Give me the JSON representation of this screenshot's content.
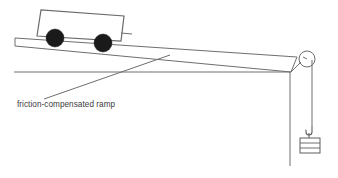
{
  "figure": {
    "background_color": "#ffffff",
    "line_color": "#6e6e6e",
    "wheel_color": "#1a1a1a",
    "text_color": "#3c3c3c"
  },
  "labels": {
    "ramp_caption": "friction-compensated ramp"
  },
  "parts": {
    "cart_name": "trolley",
    "wheel_front_name": "front-wheel",
    "wheel_rear_name": "rear-wheel",
    "ramp_name": "inclined-ramp",
    "pulley_name": "pulley",
    "string_name": "string",
    "hanging_mass_name": "slotted-mass-hanger",
    "table_edge_name": "table-edge",
    "leader_name": "caption-leader-line"
  },
  "geometry": {
    "ramp_top_left": [
      15,
      38
    ],
    "ramp_top_right": [
      296,
      57
    ],
    "ramp_bottom_left": [
      15,
      46
    ],
    "ramp_bottom_right": [
      290,
      72
    ],
    "pulley_center": [
      307,
      59
    ],
    "pulley_radius": 8,
    "table_line_left": [
      14,
      72
    ],
    "table_line_right": [
      290,
      72
    ],
    "table_edge_top": [
      290,
      72
    ],
    "table_edge_bottom": [
      290,
      166
    ],
    "string_top": [
      311,
      66
    ],
    "string_bottom": [
      311,
      127
    ],
    "mass_box": [
      302,
      136,
      20,
      16
    ],
    "caption_position": [
      17,
      106
    ],
    "leader_start": [
      44,
      99
    ],
    "leader_end": [
      170,
      55
    ]
  }
}
